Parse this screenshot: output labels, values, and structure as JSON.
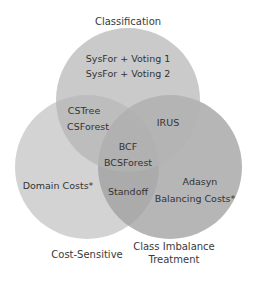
{
  "diagram": {
    "type": "venn",
    "sets": [
      {
        "name": "Classification",
        "label": "Classification",
        "color": "#c8c8c8"
      },
      {
        "name": "Cost-Sensitive",
        "label": "Cost-Sensitive",
        "color": "#d2d2d2"
      },
      {
        "name": "Class Imbalance Treatment",
        "label_line1": "Class Imbalance",
        "label_line2": "Treatment",
        "color": "#b2b2b2"
      }
    ],
    "regions": {
      "classification_only": [
        "SysFor + Voting 1",
        "SysFor + Voting 2"
      ],
      "classification_cost": [
        "CSTree",
        "CSForest"
      ],
      "classification_imbalance": [
        "IRUS"
      ],
      "all_three": [
        "BCF",
        "BCSForest"
      ],
      "cost_only": [
        "Domain Costs*"
      ],
      "cost_imbalance": [
        "Standoff"
      ],
      "imbalance_only": [
        "Adasyn",
        "Balancing Costs*"
      ]
    }
  }
}
